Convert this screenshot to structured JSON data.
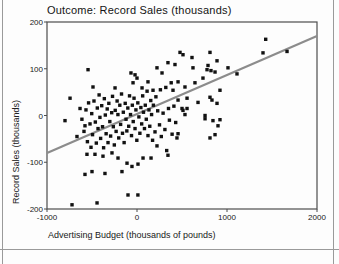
{
  "chart_data": {
    "type": "scatter",
    "title": "Outcome: Record Sales (thousands)",
    "xlabel": "Advertising Budget (thousands of pounds)",
    "ylabel": "Record Sales (thousands)",
    "xlim": [
      -1000,
      2000
    ],
    "ylim": [
      -200,
      200
    ],
    "x_ticks": [
      -1000,
      0,
      1000,
      2000
    ],
    "y_ticks": [
      -200,
      -100,
      0,
      100,
      200
    ],
    "grid": false,
    "legend": "none",
    "marker": {
      "shape": "square",
      "color": "#111111",
      "size_px": 3.4
    },
    "axis_box_color": "#4d4d4d",
    "regression_line": {
      "color": "#8c8c8c",
      "width_px": 2.2,
      "x1": -1000,
      "y1": -80,
      "x2": 2000,
      "y2": 170
    },
    "points": [
      [
        1430,
        163
      ],
      [
        1400,
        134
      ],
      [
        1667,
        137
      ],
      [
        1111,
        89
      ],
      [
        1011,
        102
      ],
      [
        922,
        54
      ],
      [
        922,
        -9
      ],
      [
        900,
        -22
      ],
      [
        889,
        117
      ],
      [
        889,
        26
      ],
      [
        867,
        93
      ],
      [
        867,
        -41
      ],
      [
        844,
        -11
      ],
      [
        833,
        33
      ],
      [
        822,
        96
      ],
      [
        811,
        135
      ],
      [
        811,
        39
      ],
      [
        811,
        -48
      ],
      [
        789,
        107
      ],
      [
        778,
        98
      ],
      [
        756,
        0
      ],
      [
        756,
        -7
      ],
      [
        733,
        80
      ],
      [
        678,
        28
      ],
      [
        644,
        70
      ],
      [
        622,
        102
      ],
      [
        611,
        124
      ],
      [
        556,
        37
      ],
      [
        556,
        15
      ],
      [
        533,
        61
      ],
      [
        533,
        2
      ],
      [
        511,
        130
      ],
      [
        511,
        11
      ],
      [
        500,
        15
      ],
      [
        478,
        135
      ],
      [
        456,
        72
      ],
      [
        456,
        33
      ],
      [
        456,
        -39
      ],
      [
        444,
        -48
      ],
      [
        422,
        109
      ],
      [
        430,
        -15
      ],
      [
        410,
        20
      ],
      [
        400,
        54
      ],
      [
        390,
        -40
      ],
      [
        380,
        70
      ],
      [
        360,
        -10
      ],
      [
        350,
        15
      ],
      [
        344,
        113
      ],
      [
        344,
        -85
      ],
      [
        330,
        -75
      ],
      [
        320,
        60
      ],
      [
        310,
        -30
      ],
      [
        290,
        5
      ],
      [
        278,
        91
      ],
      [
        270,
        -45
      ],
      [
        260,
        55
      ],
      [
        250,
        -20
      ],
      [
        230,
        10
      ],
      [
        222,
        102
      ],
      [
        222,
        -65
      ],
      [
        210,
        40
      ],
      [
        200,
        -35
      ],
      [
        178,
        54
      ],
      [
        156,
        -91
      ],
      [
        122,
        72
      ],
      [
        67,
        -91
      ],
      [
        56,
        59
      ],
      [
        11,
        -104
      ],
      [
        -544,
        98
      ],
      [
        -489,
        61
      ],
      [
        -744,
        37
      ],
      [
        -800,
        -11
      ],
      [
        -633,
        15
      ],
      [
        -578,
        -22
      ],
      [
        -667,
        -45
      ],
      [
        -22,
        87
      ],
      [
        -44,
        70
      ],
      [
        -67,
        91
      ],
      [
        0,
        80
      ],
      [
        -244,
        59
      ],
      [
        -111,
        -102
      ],
      [
        -56,
        -109
      ],
      [
        -500,
        -120
      ],
      [
        -578,
        -126
      ],
      [
        -356,
        -124
      ],
      [
        -167,
        -120
      ],
      [
        -211,
        -91
      ],
      [
        -278,
        -80
      ],
      [
        -378,
        -87
      ],
      [
        -467,
        -83
      ],
      [
        -556,
        -83
      ],
      [
        -100,
        -170
      ],
      [
        10,
        -170
      ],
      [
        -444,
        -187
      ],
      [
        -722,
        -191
      ],
      [
        -612,
        -8
      ],
      [
        -589,
        -34
      ],
      [
        -567,
        12
      ],
      [
        -551,
        -56
      ],
      [
        -538,
        27
      ],
      [
        -522,
        -18
      ],
      [
        -511,
        -68
      ],
      [
        -503,
        4
      ],
      [
        -494,
        -41
      ],
      [
        -478,
        31
      ],
      [
        -463,
        -14
      ],
      [
        -452,
        -59
      ],
      [
        -441,
        16
      ],
      [
        -433,
        -28
      ],
      [
        -421,
        44
      ],
      [
        -412,
        -4
      ],
      [
        -404,
        -49
      ],
      [
        -392,
        21
      ],
      [
        -383,
        -24
      ],
      [
        -371,
        -69
      ],
      [
        -363,
        36
      ],
      [
        -352,
        1
      ],
      [
        -343,
        -39
      ],
      [
        -331,
        14
      ],
      [
        -322,
        -58
      ],
      [
        -313,
        26
      ],
      [
        -302,
        -13
      ],
      [
        -293,
        -44
      ],
      [
        -281,
        6
      ],
      [
        -272,
        41
      ],
      [
        -263,
        -24
      ],
      [
        -252,
        -63
      ],
      [
        -242,
        11
      ],
      [
        -232,
        -34
      ],
      [
        -221,
        31
      ],
      [
        -212,
        2
      ],
      [
        -203,
        -48
      ],
      [
        -191,
        22
      ],
      [
        -182,
        -19
      ],
      [
        -172,
        46
      ],
      [
        -161,
        -38
      ],
      [
        -152,
        7
      ],
      [
        -143,
        -58
      ],
      [
        -131,
        26
      ],
      [
        -122,
        -8
      ],
      [
        -113,
        -33
      ],
      [
        -102,
        16
      ],
      [
        -92,
        -23
      ],
      [
        -83,
        42
      ],
      [
        -72,
        2
      ],
      [
        -61,
        -43
      ],
      [
        -52,
        22
      ],
      [
        -42,
        -13
      ],
      [
        -33,
        37
      ],
      [
        -22,
        -28
      ],
      [
        -12,
        12
      ],
      [
        -2,
        -53
      ],
      [
        9,
        27
      ],
      [
        21,
        -3
      ],
      [
        32,
        -38
      ],
      [
        43,
        17
      ],
      [
        52,
        -18
      ],
      [
        63,
        42
      ],
      [
        72,
        7
      ],
      [
        83,
        -28
      ],
      [
        92,
        22
      ],
      [
        103,
        -8
      ],
      [
        112,
        52
      ],
      [
        122,
        -43
      ],
      [
        133,
        12
      ],
      [
        142,
        -23
      ],
      [
        153,
        32
      ],
      [
        162,
        2
      ],
      [
        173,
        -53
      ],
      [
        182,
        22
      ]
    ],
    "plot_box_px": {
      "left": 47,
      "top": 22,
      "right": 317,
      "bottom": 209
    }
  }
}
